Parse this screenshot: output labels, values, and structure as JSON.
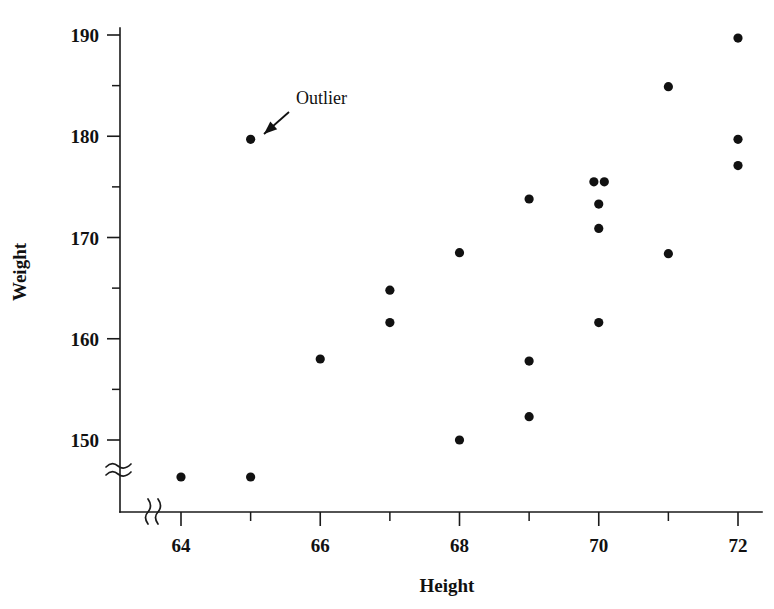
{
  "chart_data": {
    "type": "scatter",
    "title": "",
    "xlabel": "Height",
    "ylabel": "Weight",
    "xlim": [
      63.5,
      72.3
    ],
    "ylim": [
      145.0,
      191.5
    ],
    "grid": false,
    "legend_position": "none",
    "x_ticks_major": [
      64,
      66,
      68,
      70,
      72
    ],
    "x_ticks_major_labels": [
      "64",
      "66",
      "68",
      "70",
      "72"
    ],
    "x_ticks_minor": [
      65,
      67,
      69,
      71
    ],
    "y_ticks_major": [
      150,
      160,
      170,
      180,
      190
    ],
    "y_ticks_major_labels": [
      "150",
      "160",
      "170",
      "180",
      "190"
    ],
    "y_ticks_minor": [
      155,
      165,
      175,
      185
    ],
    "axis_break_x": true,
    "axis_break_y": true,
    "points": [
      {
        "x": 64,
        "y": 146.6,
        "below_break": true
      },
      {
        "x": 65,
        "y": 146.6,
        "below_break": true
      },
      {
        "x": 65,
        "y": 179.7,
        "below_break": false
      },
      {
        "x": 66,
        "y": 158.0,
        "below_break": false
      },
      {
        "x": 67,
        "y": 164.8,
        "below_break": false
      },
      {
        "x": 67,
        "y": 161.6,
        "below_break": false
      },
      {
        "x": 68,
        "y": 168.5,
        "below_break": false
      },
      {
        "x": 68,
        "y": 150.0,
        "below_break": false
      },
      {
        "x": 69,
        "y": 173.8,
        "below_break": false
      },
      {
        "x": 69,
        "y": 157.8,
        "below_break": false
      },
      {
        "x": 69,
        "y": 152.3,
        "below_break": false
      },
      {
        "x": 69.93,
        "y": 175.5,
        "below_break": false
      },
      {
        "x": 70.08,
        "y": 175.5,
        "below_break": false
      },
      {
        "x": 70,
        "y": 173.3,
        "below_break": false
      },
      {
        "x": 70,
        "y": 170.9,
        "below_break": false
      },
      {
        "x": 70,
        "y": 161.6,
        "below_break": false
      },
      {
        "x": 71,
        "y": 184.9,
        "below_break": false
      },
      {
        "x": 71,
        "y": 168.4,
        "below_break": false
      },
      {
        "x": 72,
        "y": 189.7,
        "below_break": false
      },
      {
        "x": 72,
        "y": 179.7,
        "below_break": false
      },
      {
        "x": 72,
        "y": 177.1,
        "below_break": false
      }
    ],
    "annotations": [
      {
        "text": "Outlier",
        "label_x": 296,
        "label_y": 104,
        "arrow_from_x": 289,
        "arrow_from_y": 112,
        "arrow_to_x": 264,
        "arrow_to_y": 134,
        "target_point": {
          "x": 65,
          "y": 179.7
        }
      }
    ],
    "colors": {
      "point": "#111111",
      "axis": "#1a1a1a",
      "background": "#ffffff",
      "text": "#111111"
    }
  },
  "geometry": {
    "x_axis_y": 512,
    "y_axis_x": 120,
    "y_axis_top": 28,
    "x_axis_right": 762,
    "below_break_row_y": 477,
    "xlabel_pos": {
      "x": 447,
      "y": 592
    },
    "ylabel_pos": {
      "x": 26,
      "y": 272
    }
  }
}
